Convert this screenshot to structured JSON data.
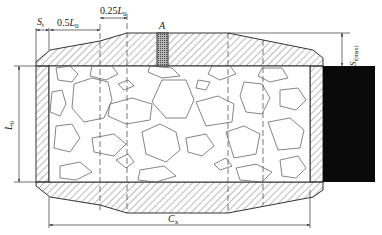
{
  "diagram": {
    "type": "engineering cross-section",
    "colors": {
      "line": "#333333",
      "hatch": "#555555",
      "rock": "#666666",
      "block": "#0a0a0a",
      "sample": "#9a9a9a"
    },
    "labels": {
      "st": {
        "main": "S",
        "sub": "t"
      },
      "half_l0": {
        "main": "0.5",
        "var": "L",
        "sub": "0"
      },
      "quarter_l0": {
        "main": "0.25",
        "var": "L",
        "sub": "0"
      },
      "a": "A",
      "l0": {
        "var": "L",
        "sub": "0"
      },
      "st_max": {
        "main": "S",
        "sub": "t(max)"
      },
      "cx": {
        "main": "C",
        "sub": "x"
      }
    },
    "dashed_lines_x": [
      100,
      127,
      228,
      263
    ]
  }
}
